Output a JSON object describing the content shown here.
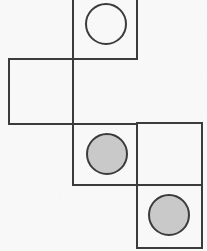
{
  "figure": {
    "kind": "cube-net-diagram",
    "title": "",
    "background_color": "#f8f8f8",
    "stroke_color": "#3b3b3b",
    "stroke_width": 2,
    "canvas": {
      "width": 207,
      "height": 251
    },
    "faces": [
      {
        "name": "top-face",
        "x": 73,
        "y": -6,
        "width": 64,
        "height": 65,
        "marker": "open-circle",
        "marker_cx": 106,
        "marker_cy": 24,
        "marker_r": 20,
        "marker_fill": "#f8f8f8",
        "marker_stroke": "#3b3b3b",
        "clipped_top": true
      },
      {
        "name": "left-face",
        "x": 9,
        "y": 59,
        "width": 64,
        "height": 65,
        "marker": "none",
        "marker_cx": null,
        "marker_cy": null,
        "marker_r": null,
        "marker_fill": null,
        "marker_stroke": null,
        "clipped_top": false
      },
      {
        "name": "center-face",
        "x": 73,
        "y": 124,
        "width": 64,
        "height": 61,
        "marker": "filled-circle",
        "marker_cx": 107,
        "marker_cy": 154,
        "marker_r": 20,
        "marker_fill": "#c9c9c9",
        "marker_stroke": "#3b3b3b",
        "clipped_top": false
      },
      {
        "name": "right-upper-face",
        "x": 137,
        "y": 123,
        "width": 65,
        "height": 62,
        "marker": "none",
        "marker_cx": null,
        "marker_cy": null,
        "marker_r": null,
        "marker_fill": null,
        "marker_stroke": null,
        "clipped_top": false
      },
      {
        "name": "right-lower-face",
        "x": 137,
        "y": 185,
        "width": 65,
        "height": 63,
        "marker": "filled-circle",
        "marker_cx": 169,
        "marker_cy": 215,
        "marker_r": 20,
        "marker_fill": "#c9c9c9",
        "marker_stroke": "#3b3b3b",
        "clipped_top": false
      }
    ]
  }
}
